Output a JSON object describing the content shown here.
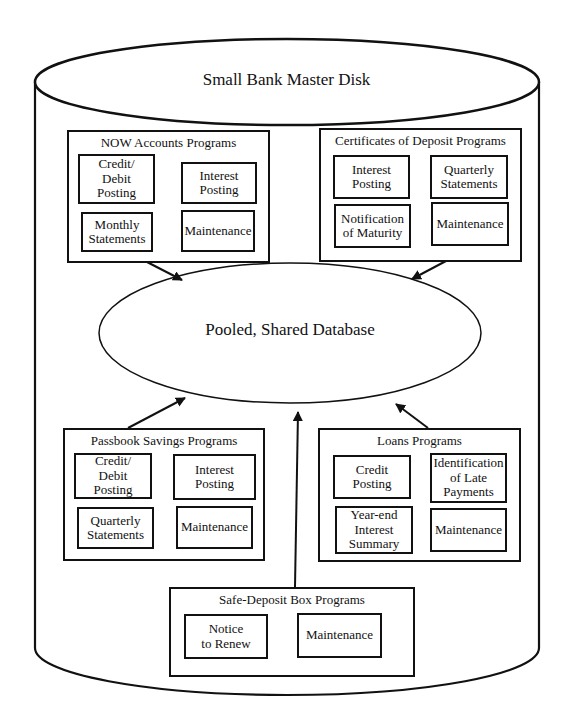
{
  "disk": {
    "title": "Small Bank Master Disk"
  },
  "database": {
    "title": "Pooled, Shared Database"
  },
  "groups": {
    "now": {
      "title": "NOW Accounts Programs",
      "programs": [
        "Credit/\nDebit\nPosting",
        "Interest\nPosting",
        "Monthly\nStatements",
        "Maintenance"
      ]
    },
    "cd": {
      "title": "Certificates of Deposit Programs",
      "programs": [
        "Interest\nPosting",
        "Quarterly\nStatements",
        "Notification\nof Maturity",
        "Maintenance"
      ]
    },
    "passbook": {
      "title": "Passbook Savings Programs",
      "programs": [
        "Credit/\nDebit\nPosting",
        "Interest\nPosting",
        "Quarterly\nStatements",
        "Maintenance"
      ]
    },
    "loans": {
      "title": "Loans Programs",
      "programs": [
        "Credit\nPosting",
        "Identification\nof Late\nPayments",
        "Year-end\nInterest\nSummary",
        "Maintenance"
      ]
    },
    "safe_deposit": {
      "title": "Safe-Deposit Box Programs",
      "programs": [
        "Notice\nto Renew",
        "Maintenance"
      ]
    }
  },
  "colors": {
    "stroke": "#111111",
    "background": "#ffffff"
  }
}
